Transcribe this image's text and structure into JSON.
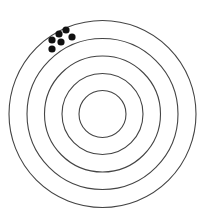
{
  "diagram": {
    "type": "target",
    "background": "#ffffff",
    "ring_color": "#444444",
    "dot_color": "#111111",
    "center": [
      102.5,
      114
    ],
    "rings": [
      {
        "r": 23.5
      },
      {
        "r": 40.5
      },
      {
        "r": 58
      },
      {
        "r": 75.5
      },
      {
        "r": 93.5
      }
    ],
    "dots": [
      {
        "x": 52,
        "y": 40
      },
      {
        "x": 59,
        "y": 34
      },
      {
        "x": 66,
        "y": 30
      },
      {
        "x": 72,
        "y": 37
      },
      {
        "x": 61,
        "y": 42
      },
      {
        "x": 52,
        "y": 49
      }
    ],
    "dot_radius": 3.6
  }
}
